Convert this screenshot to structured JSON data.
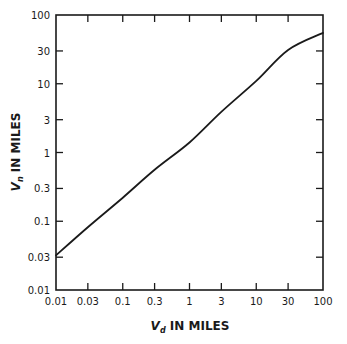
{
  "chart_data": {
    "type": "line",
    "title": "",
    "xlabel": "V_d IN MILES",
    "xlabel_main": "V",
    "xlabel_sub": "d",
    "xlabel_rest": "IN MILES",
    "ylabel": "V_n IN MILES",
    "ylabel_main": "V",
    "ylabel_sub": "n",
    "ylabel_rest": "IN MILES",
    "xscale": "log",
    "yscale": "log",
    "xlim": [
      0.01,
      100
    ],
    "ylim": [
      0.01,
      100
    ],
    "x_ticks": [
      0.01,
      0.03,
      0.1,
      0.3,
      1,
      3,
      10,
      30,
      100
    ],
    "x_tick_labels": [
      "0.01",
      "0.03",
      "0.1",
      "0.3",
      "1",
      "3",
      "10",
      "30",
      "100"
    ],
    "y_ticks": [
      0.01,
      0.03,
      0.1,
      0.3,
      1,
      3,
      10,
      30,
      100
    ],
    "y_tick_labels": [
      "0.01",
      "0.03",
      "0.1",
      "0.3",
      "1",
      "3",
      "10",
      "30",
      "100"
    ],
    "grid": false,
    "legend": null,
    "series": [
      {
        "name": "V_n vs V_d",
        "x": [
          0.01,
          0.03,
          0.1,
          0.3,
          1,
          3,
          10,
          30,
          100
        ],
        "y": [
          0.032,
          0.082,
          0.22,
          0.56,
          1.4,
          3.9,
          11,
          31,
          55
        ],
        "color": "#1a1a1a"
      }
    ]
  },
  "style": {
    "ink_color": "#1a1a1a",
    "background": "#ffffff"
  }
}
